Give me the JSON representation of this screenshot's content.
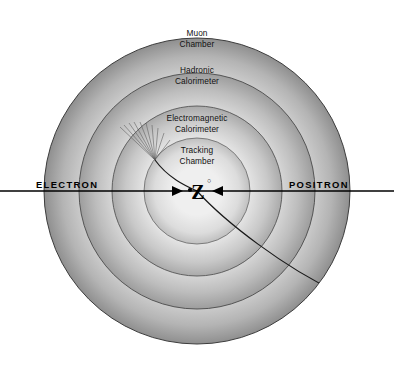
{
  "diagram": {
    "background_color": "#ffffff",
    "center": {
      "x": 197,
      "y": 191
    },
    "detector_layers": [
      {
        "name": "muon-chamber",
        "label_line1": "Muon",
        "label_line2": "Chamber",
        "outer_radius": 153,
        "inner_radius": 118,
        "label_x": 197,
        "label_y1": 36,
        "label_y2": 47,
        "fill_outer": "#9a9a9a",
        "fill_inner": "#d2d2d2"
      },
      {
        "name": "hadronic-calorimeter",
        "label_line1": "Hadronic",
        "label_line2": "Calorimeter",
        "outer_radius": 118,
        "inner_radius": 85,
        "label_x": 197,
        "label_y1": 73,
        "label_y2": 84,
        "fill_outer": "#a8a8a8",
        "fill_inner": "#dadada"
      },
      {
        "name": "electromagnetic-calorimeter",
        "label_line1": "Electromagnetic",
        "label_line2": "Calorimeter",
        "outer_radius": 85,
        "inner_radius": 53,
        "label_x": 197,
        "label_y1": 121,
        "label_y2": 132,
        "fill_outer": "#b6b6b6",
        "fill_inner": "#e2e2e2"
      },
      {
        "name": "tracking-chamber",
        "label_line1": "Tracking",
        "label_line2": "Chamber",
        "outer_radius": 53,
        "inner_radius": 0,
        "label_x": 197,
        "label_y1": 153,
        "label_y2": 164,
        "fill_outer": "#c8c8c8",
        "fill_inner": "#ededed"
      }
    ],
    "beam": {
      "axis_y": 191,
      "x_start": 0,
      "x_end": 394,
      "stroke_color": "#000000",
      "left_label": "ELECTRON",
      "left_label_x": 36,
      "left_label_y": 188,
      "right_label": "POSITRON",
      "right_label_x": 289,
      "right_label_y": 188
    },
    "collision": {
      "particle_label": "Z",
      "particle_superscript": "○",
      "label_x": 198,
      "label_y": 198,
      "arrow_left_tip_x": 183,
      "arrow_right_tip_x": 212
    },
    "tracks": [
      {
        "name": "electron-shower-track",
        "description": "curved track from collision point toward upper-left ending in electromagnetic shower",
        "stroke_color": "#1a1a1a",
        "end_x": 155,
        "end_y": 160
      },
      {
        "name": "hadron-exit-track",
        "description": "curved track from collision point toward lower-right exiting the detector",
        "stroke_color": "#1a1a1a",
        "end_x": 332,
        "end_y": 289
      }
    ],
    "shower": {
      "name": "electromagnetic-shower",
      "vertex_x": 155,
      "vertex_y": 160,
      "ray_count": 9,
      "stroke_color": "#5a5a5a"
    },
    "border": {
      "stroke_color": "#000000",
      "outline_color": "#3a3a3a"
    }
  }
}
